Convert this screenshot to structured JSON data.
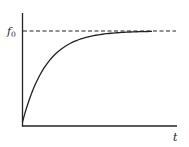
{
  "chart_data": {
    "type": "line",
    "title": "",
    "xlabel": "t",
    "ylabel": "",
    "y_tick_labels": [
      "f0"
    ],
    "y_tick_label_display": {
      "base": "f",
      "sub": "0"
    },
    "series": [
      {
        "name": "f(t)",
        "description": "saturating exponential rising from 0 toward asymptote f0",
        "x": [
          0,
          0.05,
          0.1,
          0.2,
          0.3,
          0.4,
          0.5,
          0.6,
          0.7,
          0.8,
          0.9,
          1.0
        ],
        "values": [
          0,
          0.27,
          0.45,
          0.67,
          0.8,
          0.88,
          0.93,
          0.96,
          0.975,
          0.985,
          0.992,
          0.996
        ]
      },
      {
        "name": "asymptote f0",
        "style": "dashed",
        "x": [
          0,
          1.0
        ],
        "values": [
          1.0,
          1.0
        ]
      }
    ],
    "xlim": [
      0,
      1
    ],
    "ylim": [
      0,
      1.2
    ],
    "grid": false,
    "legend": "none",
    "colors": {
      "curve": "#222222",
      "axes": "#222222",
      "dashed": "#222222"
    }
  },
  "labels": {
    "y_asymptote_base": "f",
    "y_asymptote_sub": "0",
    "x_axis": "t"
  }
}
